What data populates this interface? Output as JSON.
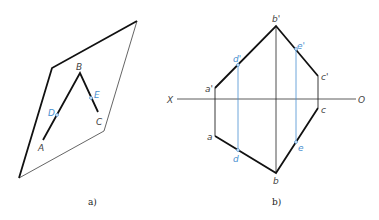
{
  "figure_a": {
    "caption": "a)",
    "plane_labels": [],
    "points": {
      "A": {
        "label": "A",
        "x": 43,
        "y": 140
      },
      "B": {
        "label": "B",
        "x": 80,
        "y": 73
      },
      "C": {
        "label": "C",
        "x": 98,
        "y": 112
      },
      "D": {
        "label": "D",
        "x": 57,
        "y": 115
      },
      "E": {
        "label": "E",
        "x": 91,
        "y": 98
      }
    },
    "plane": {
      "top_left": [
        52,
        68
      ],
      "top_right": [
        137,
        21
      ],
      "bottom_right": [
        104,
        131
      ],
      "bottom_left": [
        19,
        178
      ]
    }
  },
  "figure_b": {
    "caption": "b)",
    "axis": {
      "left_label": "X",
      "right_label": "O",
      "y": 99,
      "x1": 177,
      "x2": 356
    },
    "labels": {
      "a_prime": "a'",
      "b_prime": "b'",
      "c_prime": "c'",
      "d_prime": "d'",
      "e_prime": "e'",
      "a": "a",
      "b": "b",
      "c": "c",
      "d": "d",
      "e": "e"
    }
  },
  "colors": {
    "line": "#111111",
    "construction": "#4a8fd0",
    "label": "#444444"
  }
}
